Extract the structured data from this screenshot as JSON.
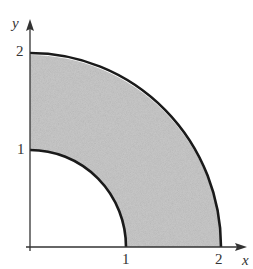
{
  "top_fragment": "gle between  and  by  ",
  "diagram": {
    "fill_color": "#c9c9c9",
    "stroke_color": "#1a1a1a",
    "axes": {
      "x_label": "x",
      "y_label": "y"
    },
    "x_ticks": [
      "1",
      "2"
    ],
    "y_ticks": [
      "1",
      "2"
    ],
    "inner_radius": 1,
    "outer_radius": 2
  }
}
